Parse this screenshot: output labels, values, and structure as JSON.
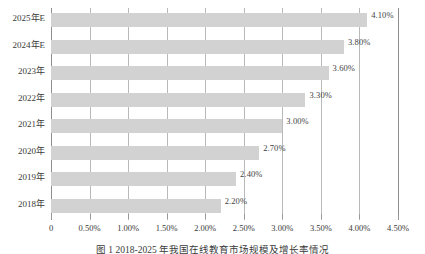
{
  "chart_data": {
    "type": "bar",
    "orientation": "horizontal",
    "title": "",
    "xlabel": "",
    "ylabel": "",
    "categories": [
      "2025年E",
      "2024年E",
      "2023年",
      "2022年",
      "2021年",
      "2020年",
      "2019年",
      "2018年"
    ],
    "values": [
      4.1,
      3.8,
      3.6,
      3.3,
      3.0,
      2.7,
      2.4,
      2.2
    ],
    "value_labels": [
      "4.10%",
      "3.80%",
      "3.60%",
      "3.30%",
      "3.00%",
      "2.70%",
      "2.40%",
      "2.20%"
    ],
    "xlim": [
      0,
      4.5
    ],
    "xticks": [
      0,
      0.5,
      1.0,
      1.5,
      2.0,
      2.5,
      3.0,
      3.5,
      4.0,
      4.5
    ],
    "xtick_labels": [
      "0",
      "0.50%",
      "1.00%",
      "1.50%",
      "2.00%",
      "2.50%",
      "3.00%",
      "3.50%",
      "4.00%",
      "4.50%"
    ],
    "grid": "vertical",
    "legend": "none",
    "bar_color": "#d2d2d2",
    "gridline_color": "#b9b9b9",
    "axis_color": "#8e8e8e",
    "text_color": "#3a3a3a"
  },
  "caption": {
    "text": "图 1 2018-2025 年我国在线教育市场规模及增长率情况"
  }
}
